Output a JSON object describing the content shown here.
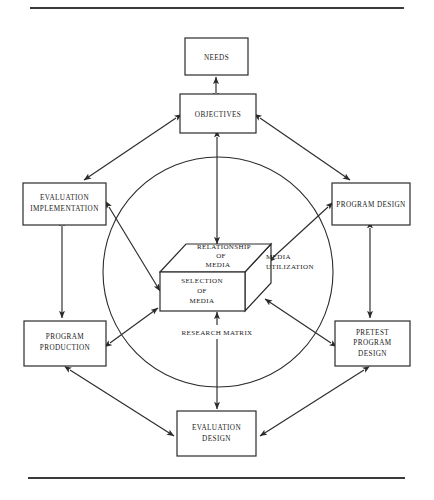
{
  "figure": {
    "background_color": "#ffffff",
    "line_color": "#2b2b2b",
    "rule_color": "#3a3a3a"
  },
  "rules": {
    "top_label": "top-horizontal-rule",
    "bottom_label": "bottom-horizontal-rule"
  },
  "boxes": {
    "needs": {
      "label": "NEEDS",
      "lines": [
        "NEEDS"
      ]
    },
    "objectives": {
      "label": "OBJECTIVES",
      "lines": [
        "OBJECTIVES"
      ]
    },
    "evaluation_implementation": {
      "label": "EVALUATION IMPLEMENTATION",
      "lines": [
        "EVALUATION",
        "IMPLEMENTATION"
      ]
    },
    "program_design": {
      "label": "PROGRAM DESIGN",
      "lines": [
        "PROGRAM DESIGN"
      ]
    },
    "program_production": {
      "label": "PROGRAM PRODUCTION",
      "lines": [
        "PROGRAM",
        "PRODUCTION"
      ]
    },
    "pretest_program_design": {
      "label": "PRETEST PROGRAM DESIGN",
      "lines": [
        "PRETEST",
        "PROGRAM",
        "DESIGN"
      ]
    },
    "evaluation_design": {
      "label": "EVALUATION DESIGN",
      "lines": [
        "EVALUATION",
        "DESIGN"
      ]
    }
  },
  "cube": {
    "top_face": {
      "label": "RELATIONSHIP OF MEDIA",
      "lines": [
        "RELATIONSHIP",
        "OF",
        "MEDIA"
      ]
    },
    "front_face": {
      "label": "SELECTION OF MEDIA",
      "lines": [
        "SELECTION",
        "OF",
        "MEDIA"
      ]
    },
    "side_label": {
      "label": "MEDIA UTILIZATION",
      "lines": [
        "MEDIA",
        "UTILIZATION"
      ]
    },
    "bottom_label": {
      "label": "RESEARCH MATRIX",
      "lines": [
        "RESEARCH MATRIX"
      ]
    }
  },
  "ring": {
    "label": "central-circle",
    "center_x": 218,
    "center_y": 272,
    "radius": 115
  },
  "connections": [
    {
      "from": "objectives",
      "to": "needs",
      "type": "double-arrow"
    },
    {
      "from": "objectives",
      "to": "cube",
      "type": "double-arrow"
    },
    {
      "from": "objectives",
      "to": "evaluation_implementation",
      "type": "double-arrow"
    },
    {
      "from": "objectives",
      "to": "program_design",
      "type": "double-arrow"
    },
    {
      "from": "evaluation_implementation",
      "to": "cube",
      "type": "double-arrow"
    },
    {
      "from": "program_design",
      "to": "cube",
      "type": "double-arrow"
    },
    {
      "from": "program_production",
      "to": "cube",
      "type": "double-arrow"
    },
    {
      "from": "pretest_program_design",
      "to": "cube",
      "type": "double-arrow"
    },
    {
      "from": "evaluation_implementation",
      "to": "program_production",
      "type": "double-arrow"
    },
    {
      "from": "program_design",
      "to": "pretest_program_design",
      "type": "double-arrow"
    },
    {
      "from": "program_production",
      "to": "evaluation_design",
      "type": "double-arrow"
    },
    {
      "from": "pretest_program_design",
      "to": "evaluation_design",
      "type": "double-arrow"
    },
    {
      "from": "cube",
      "to": "evaluation_design",
      "type": "double-arrow"
    }
  ]
}
